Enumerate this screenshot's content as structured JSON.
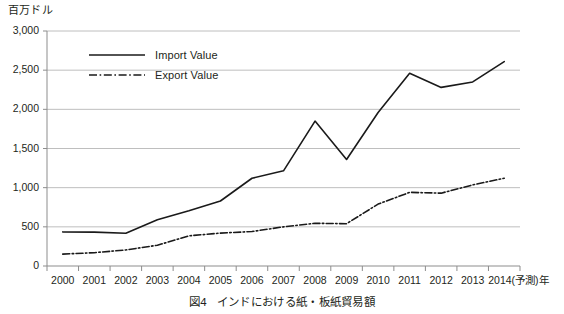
{
  "chart_data": {
    "type": "line",
    "title": "",
    "caption_number": "図4",
    "caption_text": "インドにおける紙・板紙貿易額",
    "ylabel": "百万ドル",
    "xlabel": "",
    "categories": [
      "2000",
      "2001",
      "2002",
      "2003",
      "2004",
      "2005",
      "2006",
      "2007",
      "2008",
      "2009",
      "2010",
      "2011",
      "2012",
      "2013",
      "2014"
    ],
    "x_tick_labels": [
      "2000",
      "2001",
      "2002",
      "2003",
      "2004",
      "2005",
      "2006",
      "2007",
      "2008",
      "2009",
      "2010",
      "2011",
      "2012",
      "2013",
      "2014(予測)年"
    ],
    "y_tick_labels": [
      "0",
      "500",
      "1,000",
      "1,500",
      "2,000",
      "2,500",
      "3,000"
    ],
    "y_tick_values": [
      0,
      500,
      1000,
      1500,
      2000,
      2500,
      3000
    ],
    "ylim": [
      0,
      3000
    ],
    "grid": "horizontal",
    "legend_position": "upper-left-inside",
    "series": [
      {
        "name": "Import Value",
        "style": "solid",
        "color": "#1a1a1a",
        "values": [
          435,
          432,
          418,
          590,
          705,
          830,
          1120,
          1215,
          1850,
          1360,
          1960,
          2460,
          2280,
          2350,
          2610
        ]
      },
      {
        "name": "Export Value",
        "style": "dash-dot",
        "color": "#1a1a1a",
        "values": [
          152,
          170,
          205,
          265,
          385,
          420,
          440,
          500,
          545,
          540,
          790,
          940,
          930,
          1035,
          1120
        ]
      }
    ]
  },
  "legend": {
    "items": [
      {
        "label": "Import Value"
      },
      {
        "label": "Export Value"
      }
    ]
  },
  "colors": {
    "line": "#1a1a1a",
    "grid": "#b7b7b7",
    "axis": "#8d8d8d",
    "text": "#231f20",
    "background": "#ffffff"
  }
}
